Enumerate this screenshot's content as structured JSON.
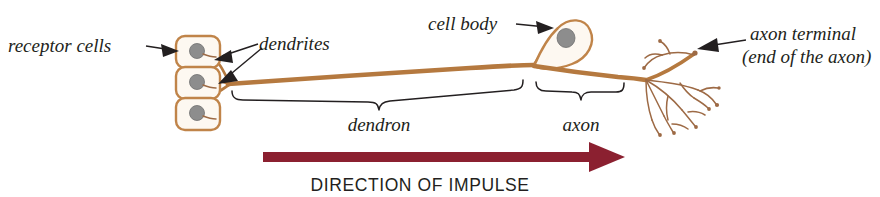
{
  "figure": {
    "background_color": "#ffffff",
    "neurite_color": "#b5793f",
    "nucleus_color": "#8d8d8d",
    "impulse_arrow_color": "#8b2030",
    "text_color": "#231f20"
  },
  "labels": {
    "receptor_cells": "receptor cells",
    "dendrites": "dendrites",
    "cell_body": "cell body",
    "axon_terminal_line1": "axon terminal",
    "axon_terminal_line2": "(end of the axon)",
    "dendron": "dendron",
    "axon": "axon"
  },
  "caption": {
    "impulse_direction": "DIRECTION OF IMPULSE"
  },
  "structure": {
    "receptor_cell_count": 3,
    "brackets": [
      "dendron",
      "axon"
    ],
    "pointer_labels": [
      "receptor cells",
      "dendrites",
      "cell body",
      "axon terminal"
    ]
  }
}
